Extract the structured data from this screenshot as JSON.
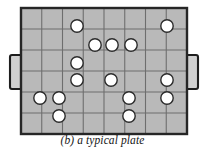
{
  "figure": {
    "label": "(b)",
    "caption": "(b) a typical plate",
    "caption_text_only": "a typical plate",
    "title_role": "figure-caption"
  },
  "plate": {
    "name": "typical plate",
    "body_fill": "#b9b9b9",
    "border_color": "#262626",
    "grid_line_color": "#6e6e6e",
    "hole_fill": "#ffffff",
    "hole_stroke": "#2b2b2b",
    "bounds": {
      "x": 21,
      "y": 8,
      "width": 166,
      "height": 126
    },
    "grid": {
      "columns": 8,
      "rows": 6,
      "cell_width": 20.75,
      "cell_height": 21,
      "show_grid": true
    },
    "hole_radius": 6.2,
    "holes": [
      {
        "id": "h1",
        "cx": 77,
        "cy": 26
      },
      {
        "id": "h2",
        "cx": 167,
        "cy": 26
      },
      {
        "id": "h3",
        "cx": 95,
        "cy": 45
      },
      {
        "id": "h4",
        "cx": 112,
        "cy": 45
      },
      {
        "id": "h5",
        "cx": 131,
        "cy": 45
      },
      {
        "id": "h6",
        "cx": 77,
        "cy": 63
      },
      {
        "id": "h7",
        "cx": 77,
        "cy": 80
      },
      {
        "id": "h8",
        "cx": 111,
        "cy": 80
      },
      {
        "id": "h9",
        "cx": 167,
        "cy": 80
      },
      {
        "id": "h10",
        "cx": 40,
        "cy": 98
      },
      {
        "id": "h11",
        "cx": 59,
        "cy": 98
      },
      {
        "id": "h12",
        "cx": 129,
        "cy": 98
      },
      {
        "id": "h13",
        "cx": 167,
        "cy": 98
      },
      {
        "id": "h14",
        "cx": 59,
        "cy": 116
      },
      {
        "id": "h15",
        "cx": 129,
        "cy": 116
      }
    ],
    "handles": [
      {
        "id": "left-handle",
        "side": "left",
        "x": 10,
        "y": 55,
        "width": 12,
        "height": 34
      },
      {
        "id": "right-handle",
        "side": "right",
        "x": 186,
        "y": 55,
        "width": 12,
        "height": 34
      }
    ]
  }
}
